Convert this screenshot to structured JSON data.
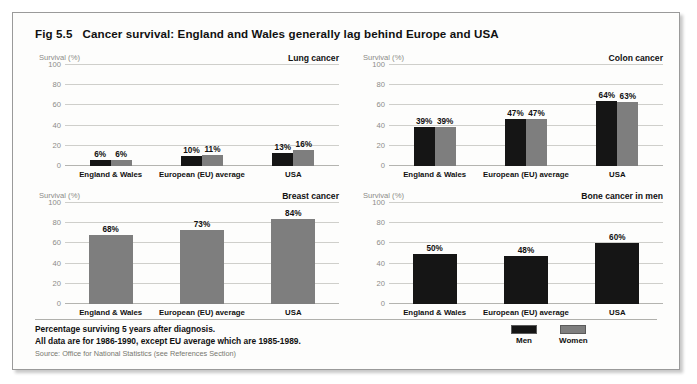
{
  "figure": {
    "number": "Fig 5.5",
    "title": "Cancer survival:  England and Wales generally lag behind Europe and USA"
  },
  "footnotes": {
    "line1": "Percentage surviving 5 years after diagnosis.",
    "line2": "All data are for 1986-1990, except EU average which are 1985-1989.",
    "source": "Source: Office for National Statistics (see References Section)"
  },
  "legend": {
    "position": "bottom-right",
    "items": [
      {
        "label": "Men",
        "color": "#151515",
        "key": "men"
      },
      {
        "label": "Women",
        "color": "#7e7e7e",
        "key": "women"
      }
    ]
  },
  "colors": {
    "men": "#151515",
    "women": "#7e7e7e",
    "gridline": "#cfcfcb",
    "axis_text": "#8c8c88",
    "text": "#111111",
    "border": "#9a9a9a",
    "background": "#fdfdfc"
  },
  "axis": {
    "ylabel": "Survival (%)",
    "yticks": [
      0,
      20,
      40,
      60,
      80,
      100
    ],
    "ylim": [
      0,
      100
    ],
    "grid": true
  },
  "chart_data": [
    {
      "id": "lung",
      "type": "bar",
      "title": "Lung cancer",
      "ylabel": "Survival (%)",
      "xlabel": "",
      "ylim": [
        0,
        100
      ],
      "yticks": [
        0,
        20,
        40,
        60,
        80,
        100
      ],
      "categories": [
        "England & Wales",
        "European (EU) average",
        "USA"
      ],
      "series": [
        {
          "name": "Men",
          "color": "#151515",
          "values": [
            6,
            10,
            13
          ],
          "labels": [
            "6%",
            "10%",
            "13%"
          ]
        },
        {
          "name": "Women",
          "color": "#7e7e7e",
          "values": [
            6,
            11,
            16
          ],
          "labels": [
            "6%",
            "11%",
            "16%"
          ]
        }
      ]
    },
    {
      "id": "colon",
      "type": "bar",
      "title": "Colon cancer",
      "ylabel": "Survival (%)",
      "xlabel": "",
      "ylim": [
        0,
        100
      ],
      "yticks": [
        0,
        20,
        40,
        60,
        80,
        100
      ],
      "categories": [
        "England & Wales",
        "European (EU) average",
        "USA"
      ],
      "series": [
        {
          "name": "Men",
          "color": "#151515",
          "values": [
            39,
            47,
            64
          ],
          "labels": [
            "39%",
            "47%",
            "64%"
          ]
        },
        {
          "name": "Women",
          "color": "#7e7e7e",
          "values": [
            39,
            47,
            63
          ],
          "labels": [
            "39%",
            "47%",
            "63%"
          ]
        }
      ]
    },
    {
      "id": "breast",
      "type": "bar",
      "title": "Breast cancer",
      "ylabel": "Survival (%)",
      "xlabel": "",
      "ylim": [
        0,
        100
      ],
      "yticks": [
        0,
        20,
        40,
        60,
        80,
        100
      ],
      "categories": [
        "England & Wales",
        "European (EU) average",
        "USA"
      ],
      "series": [
        {
          "name": "Women",
          "color": "#7e7e7e",
          "values": [
            68,
            73,
            84
          ],
          "labels": [
            "68%",
            "73%",
            "84%"
          ]
        }
      ]
    },
    {
      "id": "bone",
      "type": "bar",
      "title": "Bone cancer in men",
      "ylabel": "Survival (%)",
      "xlabel": "",
      "ylim": [
        0,
        100
      ],
      "yticks": [
        0,
        20,
        40,
        60,
        80,
        100
      ],
      "categories": [
        "England & Wales",
        "European (EU) average",
        "USA"
      ],
      "series": [
        {
          "name": "Men",
          "color": "#151515",
          "values": [
            50,
            48,
            60
          ],
          "labels": [
            "50%",
            "48%",
            "60%"
          ]
        }
      ]
    }
  ]
}
